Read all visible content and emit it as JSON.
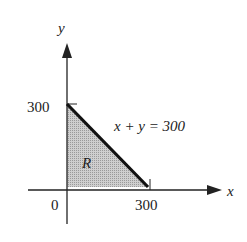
{
  "diagram": {
    "axes": {
      "x_label": "x",
      "y_label": "y",
      "origin_label": "0",
      "x_tick_label": "300",
      "y_tick_label": "300"
    },
    "region": {
      "label": "R",
      "fill_color": "#c9c9c9",
      "vertices": [
        [
          0,
          0
        ],
        [
          300,
          0
        ],
        [
          0,
          300
        ]
      ]
    },
    "line": {
      "equation": "x + y = 300",
      "color": "#111111"
    }
  }
}
